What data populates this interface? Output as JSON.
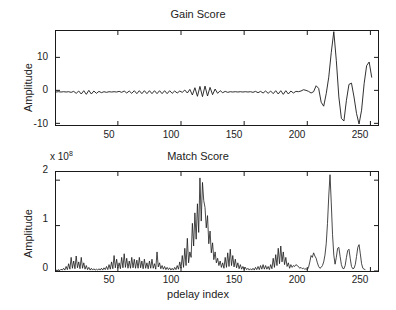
{
  "figure": {
    "width": 396,
    "height": 310,
    "background": "#ffffff",
    "line_color": "#1a1a1a",
    "axis_color": "#1a1a1a"
  },
  "chart_data": [
    {
      "type": "line",
      "id": "gain-score",
      "title": "Gain Score",
      "xlabel": "",
      "ylabel": "Amplitude",
      "xlim": [
        1,
        256
      ],
      "ylim": [
        -10.5,
        18.0
      ],
      "xticks": [
        50,
        100,
        150,
        200,
        250
      ],
      "yticks": [
        -10,
        0,
        10
      ],
      "xticklabels": [
        "50",
        "100",
        "150",
        "200",
        "250"
      ],
      "yticklabels": [
        "-10",
        "0",
        "10"
      ],
      "grid": false,
      "legend": null,
      "y_multiplier": null,
      "description": "Low-amplitude oscillation about zero for indices 1-200 with a modulated burst near index 105-125, followed by large swings after index 205; tall clipped peak near index 224 (~18) and deep trough near 246 (~-10).",
      "x": [
        1,
        3,
        5,
        7,
        9,
        11,
        13,
        15,
        17,
        19,
        21,
        23,
        25,
        27,
        29,
        31,
        33,
        35,
        37,
        39,
        41,
        43,
        45,
        47,
        49,
        51,
        53,
        55,
        57,
        59,
        61,
        63,
        65,
        67,
        69,
        71,
        73,
        75,
        77,
        79,
        81,
        83,
        85,
        87,
        89,
        91,
        93,
        95,
        97,
        99,
        101,
        103,
        105,
        107,
        109,
        111,
        113,
        115,
        117,
        119,
        121,
        123,
        125,
        127,
        129,
        131,
        133,
        135,
        137,
        139,
        141,
        143,
        145,
        147,
        149,
        151,
        153,
        155,
        157,
        159,
        161,
        163,
        165,
        167,
        169,
        171,
        173,
        175,
        177,
        179,
        181,
        183,
        185,
        187,
        189,
        191,
        193,
        195,
        197,
        199,
        201,
        203,
        205,
        207,
        209,
        211,
        213,
        215,
        217,
        219,
        221,
        223,
        225,
        227,
        229,
        231,
        233,
        235,
        237,
        239,
        241,
        243,
        245,
        247,
        249,
        251,
        253,
        255
      ],
      "y": [
        -0.5,
        -0.4,
        -0.5,
        -0.4,
        -0.5,
        -0.4,
        -0.6,
        -0.3,
        -0.9,
        -0.2,
        -1.1,
        -0.1,
        -1.2,
        0.0,
        -1.1,
        -0.2,
        -0.9,
        -0.3,
        -0.7,
        -0.4,
        -0.6,
        -0.4,
        -0.5,
        -0.4,
        -0.5,
        -0.3,
        -0.6,
        -0.2,
        -0.8,
        -0.2,
        -0.9,
        -0.1,
        -1.0,
        -0.1,
        -1.0,
        -0.1,
        -1.0,
        -0.1,
        -1.0,
        -0.1,
        -1.0,
        -0.1,
        -1.0,
        -0.1,
        -1.0,
        -0.1,
        -0.9,
        -0.2,
        -0.8,
        -0.2,
        -0.6,
        0.1,
        -0.8,
        0.3,
        -1.4,
        0.8,
        -1.8,
        1.2,
        -1.9,
        1.3,
        -1.7,
        0.9,
        -1.3,
        0.4,
        -0.9,
        -0.1,
        -0.7,
        -0.3,
        -0.6,
        -0.4,
        -0.5,
        -0.4,
        -0.5,
        -0.4,
        -0.5,
        -0.4,
        -0.5,
        -0.4,
        -0.6,
        -0.3,
        -0.7,
        -0.3,
        -0.8,
        -0.2,
        -0.9,
        -0.2,
        -1.0,
        -0.1,
        -1.1,
        -0.1,
        -1.2,
        -0.1,
        -1.1,
        -0.2,
        -0.8,
        -0.3,
        -0.4,
        -0.2,
        0.2,
        0.0,
        -0.3,
        -0.8,
        -0.4,
        1.4,
        0.6,
        -3.6,
        -4.8,
        -1.0,
        4.0,
        11.5,
        17.8,
        9.0,
        -2.0,
        -8.5,
        -9.3,
        -3.0,
        1.8,
        2.2,
        -2.0,
        -7.0,
        -10.2,
        -6.0,
        2.0,
        7.5,
        8.6,
        4.0
      ]
    },
    {
      "type": "line",
      "id": "match-score",
      "title": "Match Score",
      "xlabel": "pdelay index",
      "ylabel": "Amplitude",
      "xlim": [
        1,
        256
      ],
      "ylim": [
        0,
        2.18
      ],
      "xticks": [
        50,
        100,
        150,
        200,
        250
      ],
      "yticks": [
        0,
        1,
        2
      ],
      "xticklabels": [
        "50",
        "100",
        "150",
        "200",
        "250"
      ],
      "yticklabels": [
        "0",
        "1",
        "2"
      ],
      "y_multiplier": "x 10",
      "y_multiplier_exponent": "8",
      "grid": false,
      "legend": null,
      "description": "Sparse spiky correlation output. Noise floor of small spikes below 0.6e8 across indices 1-100, a dense tall cluster peaking ~2.05e8 near index 115-117, moderate spikes near 135-145 and 175-185, and an isolated tall peak ~2.12e8 near index 224 followed by periodic lobes at 232, 243 and 252.",
      "x": [
        1,
        2,
        3,
        4,
        5,
        6,
        7,
        8,
        9,
        10,
        11,
        12,
        13,
        14,
        15,
        16,
        17,
        18,
        19,
        20,
        21,
        22,
        23,
        24,
        25,
        26,
        27,
        28,
        29,
        30,
        31,
        32,
        33,
        34,
        35,
        36,
        37,
        38,
        39,
        40,
        41,
        42,
        43,
        44,
        45,
        46,
        47,
        48,
        49,
        50,
        51,
        52,
        53,
        54,
        55,
        56,
        57,
        58,
        59,
        60,
        61,
        62,
        63,
        64,
        65,
        66,
        67,
        68,
        69,
        70,
        71,
        72,
        73,
        74,
        75,
        76,
        77,
        78,
        79,
        80,
        81,
        82,
        83,
        84,
        85,
        86,
        87,
        88,
        89,
        90,
        91,
        92,
        93,
        94,
        95,
        96,
        97,
        98,
        99,
        100,
        101,
        102,
        103,
        104,
        105,
        106,
        107,
        108,
        109,
        110,
        111,
        112,
        113,
        114,
        115,
        116,
        117,
        118,
        119,
        120,
        121,
        122,
        123,
        124,
        125,
        126,
        127,
        128,
        129,
        130,
        131,
        132,
        133,
        134,
        135,
        136,
        137,
        138,
        139,
        140,
        141,
        142,
        143,
        144,
        145,
        146,
        147,
        148,
        149,
        150,
        151,
        152,
        153,
        154,
        155,
        156,
        157,
        158,
        159,
        160,
        161,
        162,
        163,
        164,
        165,
        166,
        167,
        168,
        169,
        170,
        171,
        172,
        173,
        174,
        175,
        176,
        177,
        178,
        179,
        180,
        181,
        182,
        183,
        184,
        185,
        186,
        187,
        188,
        189,
        190,
        191,
        192,
        193,
        194,
        195,
        196,
        197,
        198,
        199,
        200,
        201,
        202,
        203,
        204,
        205,
        206,
        207,
        208,
        209,
        210,
        211,
        212,
        213,
        214,
        215,
        216,
        217,
        218,
        219,
        220,
        221,
        222,
        223,
        224,
        225,
        226,
        227,
        228,
        229,
        230,
        231,
        232,
        233,
        234,
        235,
        236,
        237,
        238,
        239,
        240,
        241,
        242,
        243,
        244,
        245,
        246,
        247,
        248,
        249,
        250,
        251,
        252,
        253,
        254,
        255,
        256
      ],
      "y": [
        0.02,
        0.01,
        0.03,
        0.01,
        0.04,
        0.02,
        0.06,
        0.02,
        0.1,
        0.03,
        0.16,
        0.04,
        0.3,
        0.06,
        0.22,
        0.05,
        0.33,
        0.07,
        0.2,
        0.05,
        0.3,
        0.06,
        0.18,
        0.04,
        0.12,
        0.03,
        0.08,
        0.02,
        0.06,
        0.02,
        0.05,
        0.02,
        0.04,
        0.02,
        0.05,
        0.02,
        0.06,
        0.02,
        0.07,
        0.03,
        0.1,
        0.03,
        0.14,
        0.04,
        0.2,
        0.05,
        0.34,
        0.07,
        0.26,
        0.06,
        0.18,
        0.05,
        0.3,
        0.07,
        0.38,
        0.08,
        0.28,
        0.06,
        0.22,
        0.06,
        0.3,
        0.07,
        0.26,
        0.06,
        0.24,
        0.06,
        0.3,
        0.07,
        0.22,
        0.05,
        0.26,
        0.06,
        0.18,
        0.05,
        0.22,
        0.06,
        0.26,
        0.06,
        0.16,
        0.04,
        0.42,
        0.09,
        0.18,
        0.05,
        0.12,
        0.04,
        0.1,
        0.03,
        0.08,
        0.03,
        0.07,
        0.02,
        0.06,
        0.02,
        0.08,
        0.03,
        0.12,
        0.04,
        0.2,
        0.06,
        0.34,
        0.08,
        0.5,
        0.12,
        0.72,
        0.18,
        0.42,
        0.3,
        1.05,
        0.55,
        1.28,
        0.7,
        1.48,
        0.85,
        2.05,
        1.1,
        1.95,
        1.55,
        1.4,
        0.95,
        1.22,
        0.6,
        0.88,
        0.4,
        0.62,
        0.25,
        0.42,
        0.18,
        0.28,
        0.12,
        0.22,
        0.08,
        0.18,
        0.06,
        0.3,
        0.08,
        0.4,
        0.1,
        0.48,
        0.12,
        0.34,
        0.09,
        0.26,
        0.07,
        0.18,
        0.05,
        0.14,
        0.04,
        0.1,
        0.03,
        0.08,
        0.03,
        0.06,
        0.02,
        0.05,
        0.02,
        0.06,
        0.02,
        0.08,
        0.03,
        0.1,
        0.03,
        0.12,
        0.04,
        0.14,
        0.04,
        0.12,
        0.04,
        0.1,
        0.03,
        0.14,
        0.05,
        0.28,
        0.08,
        0.36,
        0.12,
        0.5,
        0.16,
        0.55,
        0.2,
        0.42,
        0.14,
        0.3,
        0.1,
        0.18,
        0.06,
        0.14,
        0.08,
        0.12,
        0.1,
        0.14,
        0.12,
        0.1,
        0.06,
        0.08,
        0.05,
        0.06,
        0.04,
        0.05,
        0.03,
        0.08,
        0.2,
        0.34,
        0.3,
        0.4,
        0.33,
        0.28,
        0.18,
        0.1,
        0.06,
        0.08,
        0.12,
        0.2,
        0.35,
        0.6,
        1.05,
        1.65,
        2.12,
        1.5,
        0.8,
        0.35,
        0.15,
        0.3,
        0.5,
        0.52,
        0.32,
        0.14,
        0.06,
        0.05,
        0.12,
        0.3,
        0.45,
        0.48,
        0.28,
        0.1,
        0.05,
        0.06,
        0.14,
        0.32,
        0.52,
        0.58,
        0.38,
        0.16,
        0.06,
        0.04,
        0.03
      ]
    }
  ]
}
